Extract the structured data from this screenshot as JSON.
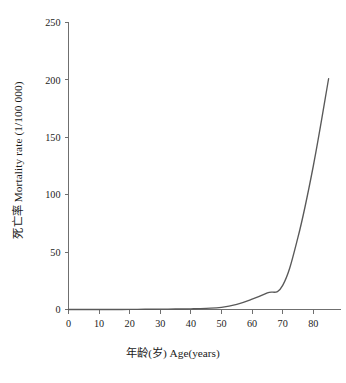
{
  "chart_data": {
    "type": "line",
    "title": "",
    "xlabel": "年龄(岁) Age(years)",
    "ylabel": "死亡率 Mortality rate (1/100 000)",
    "xlim": [
      0,
      88
    ],
    "ylim": [
      0,
      250
    ],
    "xticks": [
      0,
      10,
      20,
      30,
      40,
      50,
      60,
      70,
      80
    ],
    "yticks": [
      0,
      50,
      100,
      150,
      200,
      250
    ],
    "xtick_labels": [
      "0",
      "10",
      "20",
      "30",
      "40",
      "50",
      "60",
      "70",
      "80"
    ],
    "ytick_labels": [
      "0",
      "50",
      "100",
      "150",
      "200",
      "250"
    ],
    "grid": false,
    "legend": "none",
    "line_color": "#595959",
    "axis_color": "#6f6f6f",
    "series": [
      {
        "name": "死亡率 Mortality rate",
        "x": [
          0,
          5,
          10,
          15,
          20,
          25,
          30,
          35,
          40,
          45,
          50,
          55,
          60,
          65,
          70,
          75,
          80,
          85
        ],
        "values": [
          0,
          0,
          0,
          0,
          0.1,
          0.2,
          0.3,
          0.4,
          0.6,
          1.0,
          1.8,
          4.5,
          9.0,
          14.5,
          21.0,
          63.0,
          125.0,
          201.0
        ]
      }
    ]
  },
  "axis": {
    "y_title": "死亡率 Mortality rate (1/100 000)",
    "x_title": "年龄(岁) Age(years)"
  }
}
